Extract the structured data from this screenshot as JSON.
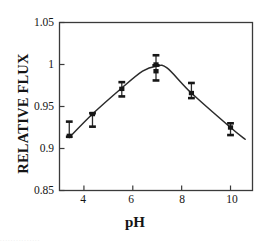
{
  "chart_data": {
    "type": "line",
    "title": "",
    "xlabel": "pH",
    "ylabel": "RELATIVE FLUX",
    "xlim": [
      3.0,
      10.9
    ],
    "ylim": [
      0.85,
      1.05
    ],
    "xticks": [
      4,
      6,
      8,
      10
    ],
    "xtick_labels": [
      "4",
      "6",
      "8",
      "10"
    ],
    "yticks": [
      0.85,
      0.9,
      0.95,
      1.0,
      1.05
    ],
    "ytick_labels": [
      "0.85",
      "0.9",
      "0.95",
      "1",
      "1.05"
    ],
    "grid": false,
    "legend": "none",
    "frame": "box",
    "marker": "square",
    "errorbars": true,
    "series": [
      {
        "name": "relative flux vs pH",
        "x": [
          3.4,
          4.35,
          5.55,
          6.95,
          6.95,
          8.4,
          10.0
        ],
        "y": [
          0.915,
          0.941,
          0.971,
          1.0,
          0.992,
          0.966,
          0.925
        ],
        "yerr_low": [
          0.914,
          0.926,
          0.962,
          0.999,
          0.981,
          0.96,
          0.916
        ],
        "yerr_high": [
          0.932,
          0.942,
          0.979,
          1.011,
          0.999,
          0.978,
          0.93
        ]
      }
    ],
    "fit_curve": {
      "name": "smoothed trend",
      "x": [
        3.4,
        4.35,
        5.55,
        6.4,
        6.95,
        7.4,
        8.4,
        10.0,
        10.6
      ],
      "y": [
        0.913,
        0.941,
        0.972,
        0.992,
        0.998,
        0.996,
        0.966,
        0.925,
        0.911
      ]
    }
  },
  "footer": {
    "clipped_text": "..............."
  }
}
